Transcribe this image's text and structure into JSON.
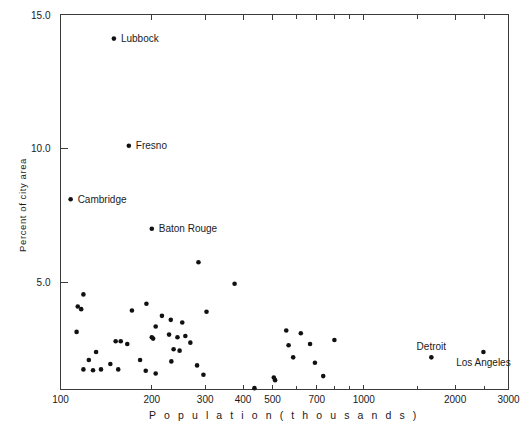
{
  "figure": {
    "background_color": "#ffffff",
    "point_color": "#111111",
    "axis_color": "#3b3b3b"
  },
  "chart_data": {
    "type": "scatter",
    "title": "",
    "xlabel": "P o p u l a t i o n   ( t h o u s a n d s )",
    "ylabel": "Percent of city area",
    "xscale": "log",
    "yscale": "linear",
    "xlim": [
      100,
      3000
    ],
    "ylim": [
      1.0,
      15.0
    ],
    "grid": false,
    "legend": "none",
    "xticks": [
      100,
      200,
      300,
      400,
      500,
      700,
      1000,
      2000,
      3000
    ],
    "xtick_labels": [
      "100",
      "200",
      "300",
      "400",
      "500",
      "700",
      "1000",
      "2000",
      "3000"
    ],
    "xticks_minor": [
      600,
      800,
      900,
      1500,
      2500
    ],
    "yticks": [
      5.0,
      10.0,
      15.0
    ],
    "ytick_labels": [
      "5.0",
      "10.0",
      "15.0"
    ],
    "annotations": [
      {
        "label": "Lubbock",
        "x": 150,
        "y": 14.1
      },
      {
        "label": "Fresno",
        "x": 168,
        "y": 10.1
      },
      {
        "label": "Cambridge",
        "x": 108,
        "y": 8.1
      },
      {
        "label": "Baton Rouge",
        "x": 200,
        "y": 7.0
      },
      {
        "label": "Detroit",
        "x": 1670,
        "y": 2.2
      },
      {
        "label": "Los Angeles",
        "x": 2480,
        "y": 2.4
      }
    ],
    "points": [
      {
        "x": 150,
        "y": 14.1,
        "label": "Lubbock"
      },
      {
        "x": 168,
        "y": 10.1,
        "label": "Fresno"
      },
      {
        "x": 108,
        "y": 8.1,
        "label": "Cambridge"
      },
      {
        "x": 200,
        "y": 7.0,
        "label": "Baton Rouge"
      },
      {
        "x": 1670,
        "y": 2.2,
        "label": "Detroit"
      },
      {
        "x": 2480,
        "y": 2.4,
        "label": "Los Angeles"
      },
      {
        "x": 285,
        "y": 5.75
      },
      {
        "x": 375,
        "y": 4.95
      },
      {
        "x": 119,
        "y": 4.55
      },
      {
        "x": 114,
        "y": 4.1
      },
      {
        "x": 117,
        "y": 4.0
      },
      {
        "x": 113,
        "y": 3.15
      },
      {
        "x": 192,
        "y": 4.2
      },
      {
        "x": 172,
        "y": 3.95
      },
      {
        "x": 216,
        "y": 3.75
      },
      {
        "x": 231,
        "y": 3.6
      },
      {
        "x": 206,
        "y": 3.35
      },
      {
        "x": 252,
        "y": 3.5
      },
      {
        "x": 200,
        "y": 2.95
      },
      {
        "x": 202,
        "y": 2.9
      },
      {
        "x": 228,
        "y": 3.05
      },
      {
        "x": 243,
        "y": 2.95
      },
      {
        "x": 258,
        "y": 3.0
      },
      {
        "x": 268,
        "y": 2.75
      },
      {
        "x": 303,
        "y": 3.9
      },
      {
        "x": 152,
        "y": 2.8
      },
      {
        "x": 158,
        "y": 2.8
      },
      {
        "x": 166,
        "y": 2.7
      },
      {
        "x": 236,
        "y": 2.5
      },
      {
        "x": 247,
        "y": 2.45
      },
      {
        "x": 131,
        "y": 2.4
      },
      {
        "x": 124,
        "y": 2.1
      },
      {
        "x": 119,
        "y": 1.75
      },
      {
        "x": 128,
        "y": 1.72
      },
      {
        "x": 136,
        "y": 1.75
      },
      {
        "x": 146,
        "y": 1.95
      },
      {
        "x": 155,
        "y": 1.75
      },
      {
        "x": 183,
        "y": 2.1
      },
      {
        "x": 232,
        "y": 2.05
      },
      {
        "x": 191,
        "y": 1.7
      },
      {
        "x": 206,
        "y": 1.6
      },
      {
        "x": 296,
        "y": 1.55
      },
      {
        "x": 282,
        "y": 1.9
      },
      {
        "x": 436,
        "y": 1.05
      },
      {
        "x": 510,
        "y": 1.35
      },
      {
        "x": 555,
        "y": 3.2
      },
      {
        "x": 620,
        "y": 3.1
      },
      {
        "x": 565,
        "y": 2.65
      },
      {
        "x": 665,
        "y": 2.7
      },
      {
        "x": 585,
        "y": 2.2
      },
      {
        "x": 690,
        "y": 2.0
      },
      {
        "x": 800,
        "y": 2.85
      },
      {
        "x": 735,
        "y": 1.5
      },
      {
        "x": 505,
        "y": 1.45
      }
    ]
  }
}
